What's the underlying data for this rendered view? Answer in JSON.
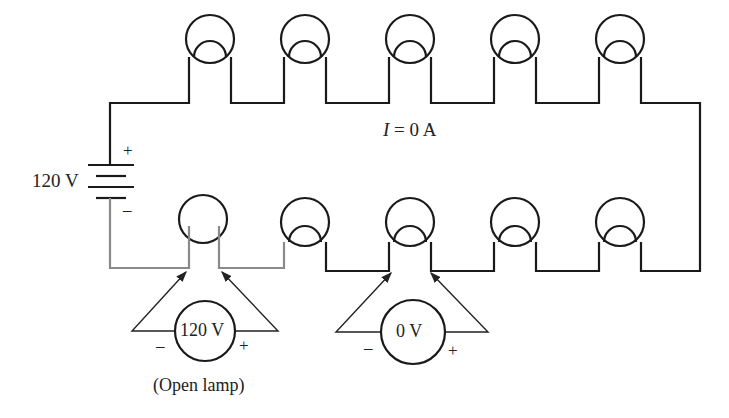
{
  "diagram": {
    "type": "series-lamp-circuit",
    "source": {
      "label": "120 V",
      "plus": "+",
      "minus": "–"
    },
    "current_label": {
      "var": "I",
      "rest": " = 0 A"
    },
    "lamps_top": 5,
    "lamps_bottom": 5,
    "open_lamp_index": 0,
    "voltmeters": [
      {
        "reading": "120 V",
        "minus": "–",
        "plus": "+",
        "caption": "(Open lamp)"
      },
      {
        "reading": "0 V",
        "minus": "–",
        "plus": "+"
      }
    ],
    "colors": {
      "wire": "#1a1a1a",
      "open_path": "#8a8a8a"
    }
  }
}
